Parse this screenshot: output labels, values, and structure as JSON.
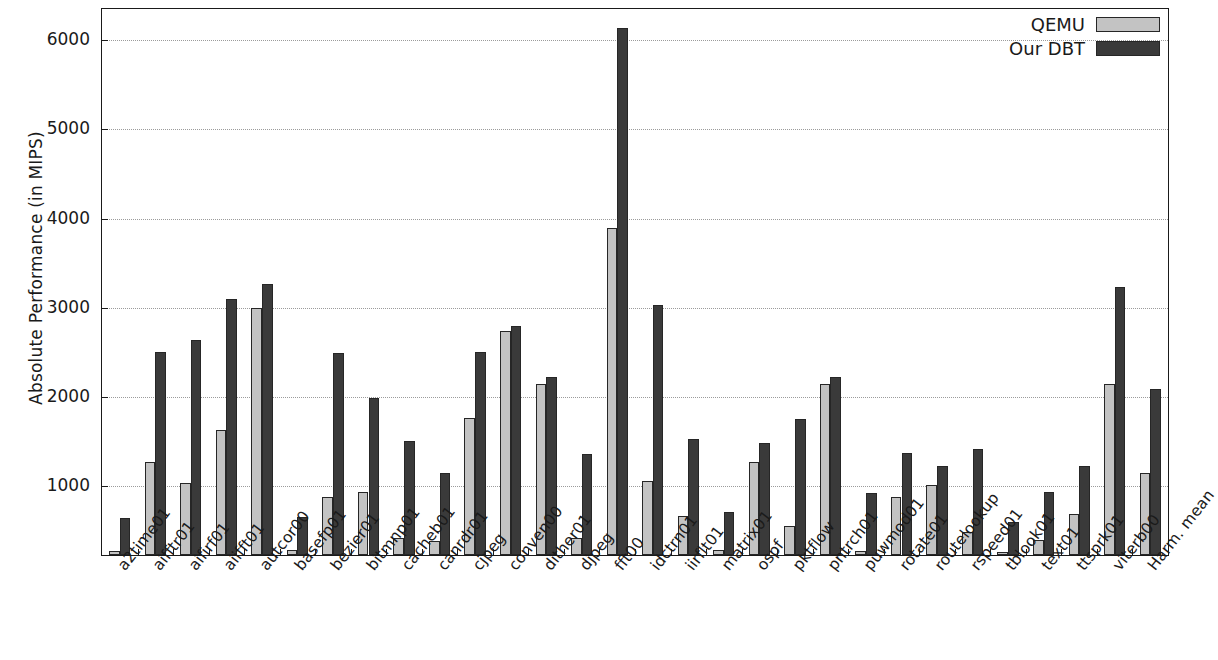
{
  "chart_data": {
    "type": "bar",
    "title": "",
    "xlabel": "",
    "ylabel": "Absolute Performance (in MIPS)",
    "ylim": [
      230,
      6350
    ],
    "yticks": [
      1000,
      2000,
      3000,
      4000,
      5000,
      6000
    ],
    "ytick_labels": [
      "1000",
      "2000",
      "3000",
      "4000",
      "5000",
      "6000"
    ],
    "grid": true,
    "legend_position": "top-right",
    "categories": [
      "a2time01",
      "aifftr01",
      "aifirf01",
      "aiifft01",
      "autcor00",
      "basefp01",
      "bezier01",
      "bitmnp01",
      "cacheb01",
      "canrdr01",
      "cjpeg",
      "conven00",
      "dither01",
      "djpeg",
      "fft00",
      "idctrn01",
      "iirflt01",
      "matrix01",
      "ospf",
      "pktflow",
      "pntrch01",
      "puwmod01",
      "rotate01",
      "routelookup",
      "rspeed01",
      "tblook01",
      "text01",
      "ttsprk01",
      "viterb00",
      "Harm. mean"
    ],
    "series": [
      {
        "name": "QEMU",
        "color": "#c3c3c3",
        "values": [
          280,
          1270,
          1040,
          1630,
          3000,
          290,
          880,
          940,
          420,
          390,
          1770,
          2740,
          2150,
          420,
          3900,
          1060,
          670,
          290,
          1270,
          550,
          2150,
          280,
          880,
          1010,
          490,
          260,
          400,
          690,
          2150,
          1150
        ]
      },
      {
        "name": "Our DBT",
        "color": "#3a3a3a",
        "values": [
          640,
          2510,
          2640,
          3100,
          3270,
          660,
          2490,
          1990,
          1510,
          1150,
          2510,
          2800,
          2220,
          1360,
          6140,
          3030,
          1530,
          710,
          1480,
          1760,
          2230,
          930,
          1370,
          1230,
          1420,
          600,
          940,
          1230,
          3230,
          2090
        ]
      }
    ]
  },
  "legend": {
    "entries": [
      {
        "label": "QEMU",
        "swatch": "legend-swatch-qemu"
      },
      {
        "label": "Our DBT",
        "swatch": "legend-swatch-dbt"
      }
    ]
  },
  "axes": {
    "y_title": "Absolute Performance (in MIPS)"
  }
}
